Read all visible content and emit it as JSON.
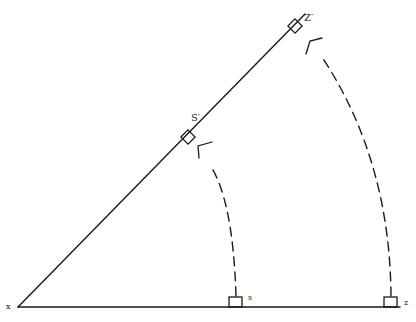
{
  "diagram": {
    "colors": {
      "ink": "#1a1a1a",
      "background": "#ffffff"
    },
    "vertex": {
      "label": "x",
      "x": 18,
      "y": 307
    },
    "baseline": {
      "x1": 18,
      "y1": 307,
      "x2": 400,
      "y2": 307
    },
    "rotated_line": {
      "x1": 18,
      "y1": 307,
      "x2": 305,
      "y2": 14
    },
    "points": [
      {
        "id": "s",
        "label": "s",
        "box": {
          "x": 229,
          "y": 297,
          "w": 13,
          "h": 10
        },
        "label_pos": {
          "x": 248,
          "y": 300
        }
      },
      {
        "id": "z",
        "label": "z",
        "box": {
          "x": 384,
          "y": 297,
          "w": 13,
          "h": 10
        },
        "label_pos": {
          "x": 404,
          "y": 305
        }
      }
    ],
    "rotated_points": [
      {
        "id": "s-prime",
        "label": "S′",
        "center": {
          "x": 188,
          "y": 137
        },
        "size": 10,
        "label_pos": {
          "x": 191,
          "y": 121
        }
      },
      {
        "id": "z-prime",
        "label": "Z′",
        "center": {
          "x": 295,
          "y": 26
        },
        "size": 10,
        "label_pos": {
          "x": 304,
          "y": 21
        }
      }
    ],
    "arcs": [
      {
        "id": "arc-s",
        "path": "M 236 296 Q 233 200 210 165",
        "arrow": {
          "tip": [
            198,
            146
          ],
          "a": [
            212,
            142
          ],
          "b": [
            199,
            158
          ]
        }
      },
      {
        "id": "arc-z",
        "path": "M 391 296 Q 390 160 322 57",
        "arrow": {
          "tip": [
            310,
            41
          ],
          "a": [
            322,
            38
          ],
          "b": [
            306,
            54
          ]
        }
      }
    ]
  }
}
